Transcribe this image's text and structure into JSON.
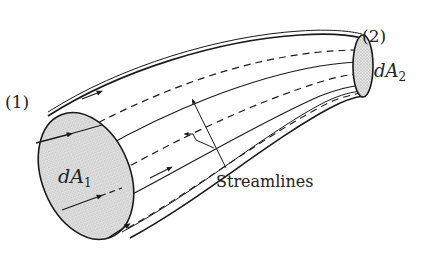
{
  "diagram": {
    "labels": {
      "section_1": "(1)",
      "section_2": "(2)",
      "area_1_main": "dA",
      "area_1_sub": "1",
      "area_2_main": "dA",
      "area_2_sub": "2",
      "streamlines": "Streamlines"
    },
    "colors": {
      "stroke": "#1a1a1a",
      "fill_section": "#d4d4d4",
      "background": "#ffffff"
    }
  }
}
